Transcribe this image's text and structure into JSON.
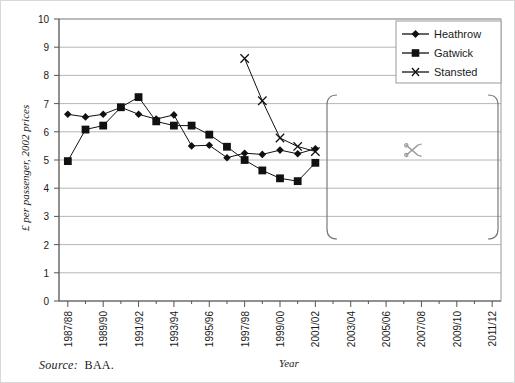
{
  "chart_data": {
    "type": "line",
    "title": "",
    "xlabel": "Year",
    "ylabel": "£ per passenger, 2002 prices",
    "ylim": [
      0,
      10
    ],
    "ytick_step": 1,
    "grid": true,
    "legend_position": "top-right",
    "x_all": [
      "1987/88",
      "1988/89",
      "1989/90",
      "1990/91",
      "1991/92",
      "1992/93",
      "1993/94",
      "1994/95",
      "1995/96",
      "1996/97",
      "1997/98",
      "1998/99",
      "1999/00",
      "2000/01",
      "2001/02",
      "2002/03",
      "2003/04",
      "2004/05",
      "2005/06",
      "2006/07",
      "2007/08",
      "2008/09",
      "2009/10",
      "2010/11",
      "2011/12"
    ],
    "categories": [
      "1987/88",
      "",
      "1989/90",
      "",
      "1991/92",
      "",
      "1993/94",
      "",
      "1995/96",
      "",
      "1997/98",
      "",
      "1999/00",
      "",
      "2001/02",
      "",
      "2003/04",
      "",
      "2005/06",
      "",
      "2007/08",
      "",
      "2009/10",
      "",
      "2011/12"
    ],
    "xtick_labels": [
      "1987/88",
      "1989/90",
      "1991/92",
      "1993/94",
      "1995/96",
      "1997/98",
      "1999/00",
      "2001/02",
      "2003/04",
      "2005/06",
      "2007/08",
      "2009/10",
      "2011/12"
    ],
    "yticks": [
      0,
      1,
      2,
      3,
      4,
      5,
      6,
      7,
      8,
      9,
      10
    ],
    "series": [
      {
        "name": "Heathrow",
        "marker": "diamond",
        "color": "#111111",
        "x": [
          "1987/88",
          "1988/89",
          "1989/90",
          "1990/91",
          "1991/92",
          "1992/93",
          "1993/94",
          "1994/95",
          "1995/96",
          "1996/97",
          "1997/98",
          "1998/99",
          "1999/00",
          "2000/01",
          "2001/02"
        ],
        "values": [
          6.62,
          6.53,
          6.62,
          6.87,
          6.62,
          6.45,
          6.6,
          5.5,
          5.52,
          5.08,
          5.24,
          5.2,
          5.35,
          5.22,
          5.4
        ]
      },
      {
        "name": "Gatwick",
        "marker": "square",
        "color": "#111111",
        "x": [
          "1987/88",
          "1988/89",
          "1989/90",
          "1990/91",
          "1991/92",
          "1992/93",
          "1993/94",
          "1994/95",
          "1995/96",
          "1996/97",
          "1997/98",
          "1998/99",
          "1999/00",
          "2000/01",
          "2001/02"
        ],
        "values": [
          4.96,
          6.08,
          6.22,
          6.87,
          7.23,
          6.37,
          6.22,
          6.22,
          5.9,
          5.47,
          5.0,
          4.63,
          4.35,
          4.25,
          4.9
        ]
      },
      {
        "name": "Stansted",
        "marker": "cross",
        "color": "#111111",
        "x": [
          "1997/98",
          "1998/99",
          "1999/00",
          "2000/01",
          "2001/02"
        ],
        "values": [
          8.6,
          7.1,
          5.78,
          5.48,
          5.3
        ]
      }
    ]
  },
  "legend": {
    "items": [
      {
        "label": "Heathrow",
        "marker": "diamond"
      },
      {
        "label": "Gatwick",
        "marker": "square"
      },
      {
        "label": "Stansted",
        "marker": "cross"
      }
    ]
  },
  "annotations": {
    "cut_region": {
      "icon": "scissors-icon",
      "x_start_label": "2002/03",
      "x_end_label": "2011/12"
    }
  },
  "footer": {
    "source_prefix": "Source:",
    "source_value": "BAA."
  }
}
